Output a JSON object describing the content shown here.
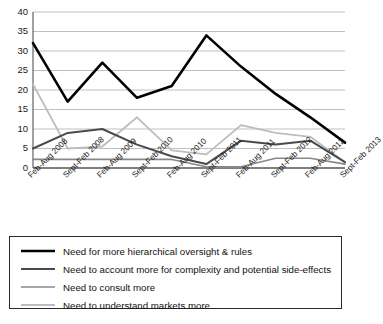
{
  "chart_data": {
    "type": "line",
    "title": "",
    "xlabel": "",
    "ylabel": "",
    "ylim": [
      0,
      40
    ],
    "ytick_step": 5,
    "yticks": [
      0,
      5,
      10,
      15,
      20,
      25,
      30,
      35,
      40
    ],
    "grid": true,
    "legend_position": "bottom",
    "categories": [
      "Feb-Aug 2008",
      "Sept-Feb 2008",
      "Feb-Aug 2009",
      "Sept-Feb 2010",
      "Feb-Aug 2010",
      "Sept-Feb 2011",
      "Feb-Aug 2011",
      "Sept-Feb 2012",
      "Feb-Aug 2012",
      "Sept-Feb 2013"
    ],
    "series": [
      {
        "name": "Need for more hierarchical oversight & rules",
        "color": "#000000",
        "width": 2.6,
        "values": [
          32,
          17,
          27,
          18,
          21,
          34,
          26,
          19,
          13,
          6.5
        ]
      },
      {
        "name": "Need to account more for complexity and potential side-effects",
        "color": "#4a4a4a",
        "width": 2.0,
        "values": [
          5,
          9,
          10,
          6,
          3,
          1,
          7,
          6,
          7,
          1.5
        ]
      },
      {
        "name": "Need to consult more",
        "color": "#888888",
        "width": 1.6,
        "values": [
          2.2,
          2.2,
          2.2,
          2.2,
          2.2,
          0.3,
          0.3,
          2.5,
          2.5,
          1.0
        ]
      },
      {
        "name": "Need to understand markets more",
        "color": "#bdbdbd",
        "width": 1.8,
        "values": [
          21.5,
          5,
          5.5,
          13,
          4.5,
          3.5,
          11,
          9,
          8,
          1.5
        ]
      }
    ]
  },
  "legend": {
    "items": [
      {
        "label": "Need for more hierarchical oversight & rules"
      },
      {
        "label": "Need to account more for complexity and potential side-effects"
      },
      {
        "label": "Need to consult more"
      },
      {
        "label": "Need to understand markets more"
      }
    ]
  }
}
